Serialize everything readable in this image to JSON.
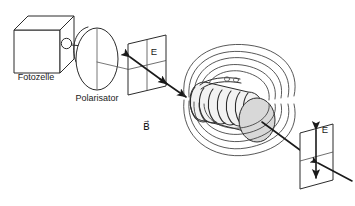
{
  "figure": {
    "background_color": "#ffffff",
    "line_color": "#2b2b2b",
    "label_color": "#1a1a1a",
    "width": 355,
    "height": 206
  },
  "labels": {
    "photocell": "Fotozelle",
    "polarizer": "Polarisator",
    "e_field_left": "E",
    "e_field_right": "E",
    "b_field": "B⃗"
  },
  "components": {
    "photocell": {
      "name": "Fotozelle",
      "shape": "cube",
      "detail": "sensor-aperture-circle"
    },
    "polarizer": {
      "name": "Polarisator",
      "shape": "disk",
      "detail": "vertical-transmission-axis"
    },
    "plane_left": {
      "name": "E",
      "shape": "parallelogram-grid",
      "arrow": "double-headed-diagonal"
    },
    "plane_right": {
      "name": "E",
      "shape": "parallelogram-grid",
      "arrow": "double-headed-vertical"
    },
    "solenoid": {
      "name": "Spule",
      "turns": 8,
      "end_cap": "#d8d8d8"
    },
    "field_lines": {
      "name": "B⃗",
      "count": 5,
      "shape": "concentric-loops"
    }
  }
}
